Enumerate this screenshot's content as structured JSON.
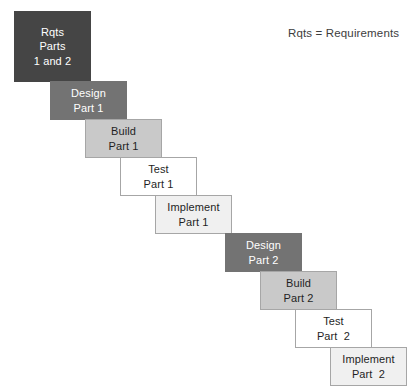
{
  "diagram": {
    "background_color": "#ffffff",
    "legend": {
      "text": "Rqts = Requirements",
      "x": 288,
      "y": 27,
      "color": "#3d3d3d"
    },
    "stages": [
      {
        "name": "requirements-parts-1-and-2",
        "lines": [
          "Rqts",
          "Parts",
          "1 and 2"
        ],
        "x": 14,
        "y": 11,
        "width": 77,
        "height": 71,
        "fill": "#454545",
        "border": "#454545",
        "text_color": "#ffffff"
      },
      {
        "name": "design-part-1",
        "lines": [
          "Design",
          "Part 1"
        ],
        "x": 50,
        "y": 81,
        "width": 77,
        "height": 39,
        "fill": "#737373",
        "border": "#737373",
        "text_color": "#ffffff"
      },
      {
        "name": "build-part-1",
        "lines": [
          "Build",
          "Part 1"
        ],
        "x": 85,
        "y": 119,
        "width": 77,
        "height": 39,
        "fill": "#c9c9c9",
        "border": "#a6a6a6",
        "text_color": "#1f1f1f"
      },
      {
        "name": "test-part-1",
        "lines": [
          "Test",
          "Part 1"
        ],
        "x": 120,
        "y": 157,
        "width": 77,
        "height": 39,
        "fill": "#ffffff",
        "border": "#a6a6a6",
        "text_color": "#1f1f1f"
      },
      {
        "name": "implement-part-1",
        "lines": [
          "Implement",
          "Part 1"
        ],
        "x": 155,
        "y": 195,
        "width": 77,
        "height": 39,
        "fill": "#f0f0f0",
        "border": "#a6a6a6",
        "text_color": "#1f1f1f"
      },
      {
        "name": "design-part-2",
        "lines": [
          "Design",
          "Part 2"
        ],
        "x": 225,
        "y": 233,
        "width": 77,
        "height": 39,
        "fill": "#737373",
        "border": "#737373",
        "text_color": "#ffffff"
      },
      {
        "name": "build-part-2",
        "lines": [
          "Build",
          "Part 2"
        ],
        "x": 260,
        "y": 271,
        "width": 77,
        "height": 39,
        "fill": "#c9c9c9",
        "border": "#a6a6a6",
        "text_color": "#1f1f1f"
      },
      {
        "name": "test-part-2",
        "lines": [
          "Test",
          "Part  2"
        ],
        "x": 295,
        "y": 309,
        "width": 77,
        "height": 39,
        "fill": "#ffffff",
        "border": "#a6a6a6",
        "text_color": "#1f1f1f"
      },
      {
        "name": "implement-part-2",
        "lines": [
          "Implement",
          "Part  2"
        ],
        "x": 330,
        "y": 347,
        "width": 77,
        "height": 39,
        "fill": "#f0f0f0",
        "border": "#a6a6a6",
        "text_color": "#1f1f1f"
      }
    ]
  }
}
